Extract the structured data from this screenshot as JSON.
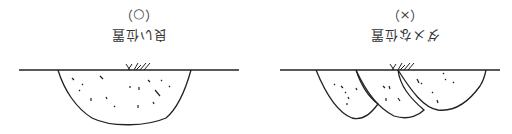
{
  "orientation": "rotated-180",
  "panels": [
    {
      "mark": "（×）",
      "label": "ダメな位置"
    },
    {
      "mark": "（○）",
      "label": "良い位置"
    }
  ],
  "colors": {
    "line": "#222222",
    "text": "#333333",
    "background": "#ffffff"
  }
}
